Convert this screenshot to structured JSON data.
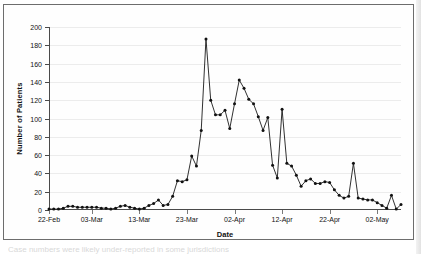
{
  "figure": {
    "bottom_cut_text": "Case numbers were likely under-reported in some jurisdictions",
    "colors": {
      "line": "#1a1a1a",
      "marker": "#111111",
      "axis": "#4a4a4a",
      "grid": "#ececec",
      "frame": "#6d6d6d",
      "background": "#fefefe"
    }
  },
  "chart_data": {
    "type": "line",
    "title": "",
    "xlabel": "Date",
    "ylabel": "Number of Patients",
    "ylim": [
      0,
      200
    ],
    "ytick_values": [
      0,
      20,
      40,
      60,
      80,
      100,
      120,
      140,
      160,
      180,
      200
    ],
    "ytick_labels": [
      "0",
      "20",
      "40",
      "60",
      "80",
      "100",
      "120",
      "140",
      "160",
      "180",
      "200"
    ],
    "xtick_labels": [
      "22-Feb",
      "03-Mar",
      "13-Mar",
      "23-Mar",
      "02-Apr",
      "12-Apr",
      "22-Apr",
      "02-May"
    ],
    "xtick_indices": [
      0,
      9,
      19,
      29,
      39,
      49,
      59,
      69
    ],
    "grid": "horizontal",
    "legend": "none",
    "markers": "filled-circle",
    "x": [
      "22-Feb",
      "23-Feb",
      "24-Feb",
      "25-Feb",
      "26-Feb",
      "27-Feb",
      "28-Feb",
      "01-Mar",
      "02-Mar",
      "03-Mar",
      "04-Mar",
      "05-Mar",
      "06-Mar",
      "07-Mar",
      "08-Mar",
      "09-Mar",
      "10-Mar",
      "11-Mar",
      "12-Mar",
      "13-Mar",
      "14-Mar",
      "15-Mar",
      "16-Mar",
      "17-Mar",
      "18-Mar",
      "19-Mar",
      "20-Mar",
      "21-Mar",
      "22-Mar",
      "23-Mar",
      "24-Mar",
      "25-Mar",
      "26-Mar",
      "27-Mar",
      "28-Mar",
      "29-Mar",
      "30-Mar",
      "31-Mar",
      "01-Apr",
      "02-Apr",
      "03-Apr",
      "04-Apr",
      "05-Apr",
      "06-Apr",
      "07-Apr",
      "08-Apr",
      "09-Apr",
      "10-Apr",
      "11-Apr",
      "12-Apr",
      "13-Apr",
      "14-Apr",
      "15-Apr",
      "16-Apr",
      "17-Apr",
      "18-Apr",
      "19-Apr",
      "20-Apr",
      "21-Apr",
      "22-Apr",
      "23-Apr",
      "24-Apr",
      "25-Apr",
      "26-Apr",
      "27-Apr",
      "28-Apr",
      "29-Apr",
      "30-Apr",
      "01-May",
      "02-May",
      "03-May",
      "04-May",
      "05-May",
      "06-May",
      "07-May"
    ],
    "values": [
      1,
      1,
      1,
      2,
      4,
      4,
      3,
      3,
      3,
      3,
      3,
      2,
      2,
      1,
      2,
      4,
      5,
      3,
      2,
      1,
      2,
      5,
      7,
      11,
      5,
      6,
      15,
      32,
      31,
      33,
      59,
      48,
      87,
      187,
      120,
      104,
      104,
      109,
      89,
      116,
      142,
      133,
      121,
      116,
      102,
      87,
      101,
      49,
      35,
      110,
      51,
      48,
      38,
      26,
      32,
      34,
      29,
      29,
      31,
      30,
      22,
      16,
      13,
      15,
      51,
      13,
      12,
      11,
      11,
      8,
      5,
      2,
      16,
      1,
      6
    ]
  }
}
